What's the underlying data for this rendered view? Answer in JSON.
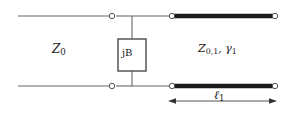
{
  "figure": {
    "type": "transmission-line-circuit-schematic",
    "background_color": "#ffffff",
    "line_color": "#555555",
    "thick_line_color": "#1a1a1a",
    "text_color": "#1a1a1a",
    "width": 292,
    "height": 114
  },
  "labels": {
    "source_impedance": "Z",
    "source_impedance_sub": "0",
    "shunt_element": "jB",
    "line_impedance": "Z",
    "line_impedance_sub": "0,1",
    "line_gamma_sep": ", ",
    "line_gamma": "γ",
    "line_gamma_sub": "1",
    "length": "ℓ",
    "length_sub": "1"
  },
  "nodes": {
    "top_left_terminal": "port-node",
    "bottom_left_terminal": "port-node",
    "top_right_terminal": "port-node",
    "bottom_right_terminal": "port-node",
    "top_line_start": "line-node",
    "bottom_line_start": "line-node"
  },
  "dimension": {
    "arrow_label": "ℓ₁",
    "arrow_style": "double-headed"
  }
}
